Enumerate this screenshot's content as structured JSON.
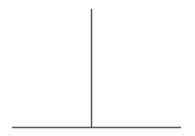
{
  "diagram": {
    "shape": "inverted-T",
    "background": "#ffffff",
    "stroke_color": "#555555",
    "stroke_width": 1.5,
    "vertical_line": {
      "x": 91.5,
      "y1": 9,
      "y2": 128
    },
    "horizontal_line": {
      "y": 127.5,
      "x1": 12,
      "x2": 181
    }
  }
}
